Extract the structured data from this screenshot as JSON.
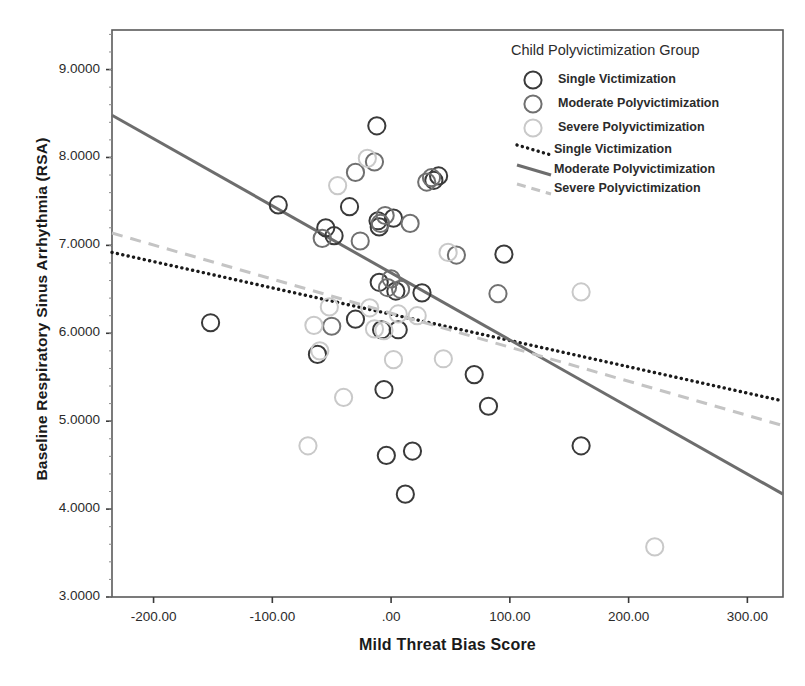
{
  "chart_data": {
    "type": "scatter",
    "title": "",
    "xlabel": "Mild Threat Bias Score",
    "ylabel": "Baseline Respiratory Sinus Arrhythmia (RSA)",
    "xlim": [
      -235,
      330
    ],
    "ylim": [
      3.0,
      9.45
    ],
    "grid": false,
    "legend_position": "top-right",
    "legend_title": "Child Polyvictimization Group",
    "xticks": [
      -200,
      -100,
      0,
      100,
      200,
      300
    ],
    "xtick_labels": [
      "-200.00",
      "-100.00",
      ".00",
      "100.00",
      "200.00",
      "300.00"
    ],
    "yticks": [
      3,
      4,
      5,
      6,
      7,
      8,
      9
    ],
    "ytick_labels": [
      "3.0000",
      "4.0000",
      "5.0000",
      "6.0000",
      "7.0000",
      "8.0000",
      "9.0000"
    ],
    "colors": {
      "single": "#3a3a3a",
      "moderate": "#707070",
      "severe": "#c9c9c9"
    },
    "series": [
      {
        "name": "Single Victimization",
        "marker": "open-circle",
        "color": "#3a3a3a",
        "points": [
          [
            -152,
            6.12
          ],
          [
            -95,
            7.46
          ],
          [
            -62,
            5.76
          ],
          [
            -55,
            7.2
          ],
          [
            -48,
            7.11
          ],
          [
            -35,
            7.44
          ],
          [
            -30,
            6.16
          ],
          [
            -12,
            8.36
          ],
          [
            -11,
            7.28
          ],
          [
            -10,
            7.21
          ],
          [
            -10,
            6.58
          ],
          [
            -8,
            6.04
          ],
          [
            -6,
            5.36
          ],
          [
            -4,
            4.61
          ],
          [
            2,
            7.31
          ],
          [
            4,
            6.48
          ],
          [
            6,
            6.04
          ],
          [
            12,
            4.17
          ],
          [
            18,
            4.66
          ],
          [
            26,
            6.46
          ],
          [
            36,
            7.74
          ],
          [
            40,
            7.79
          ],
          [
            70,
            5.53
          ],
          [
            82,
            5.17
          ],
          [
            95,
            6.9
          ],
          [
            160,
            4.72
          ]
        ]
      },
      {
        "name": "Moderate Polyvictimization",
        "marker": "open-circle",
        "color": "#707070",
        "points": [
          [
            -58,
            7.08
          ],
          [
            -50,
            6.08
          ],
          [
            -30,
            7.83
          ],
          [
            -26,
            7.05
          ],
          [
            -14,
            7.95
          ],
          [
            -9,
            7.25
          ],
          [
            -5,
            7.34
          ],
          [
            -3,
            6.52
          ],
          [
            0,
            6.62
          ],
          [
            8,
            6.5
          ],
          [
            16,
            7.25
          ],
          [
            30,
            7.72
          ],
          [
            34,
            7.77
          ],
          [
            55,
            6.89
          ],
          [
            90,
            6.45
          ]
        ]
      },
      {
        "name": "Severe Polyvictimization",
        "marker": "open-circle",
        "color": "#c9c9c9",
        "points": [
          [
            -70,
            4.72
          ],
          [
            -65,
            6.09
          ],
          [
            -60,
            5.8
          ],
          [
            -52,
            6.3
          ],
          [
            -45,
            7.68
          ],
          [
            -40,
            5.27
          ],
          [
            -20,
            7.99
          ],
          [
            -18,
            6.29
          ],
          [
            -14,
            6.05
          ],
          [
            -6,
            6.03
          ],
          [
            2,
            5.7
          ],
          [
            6,
            6.22
          ],
          [
            22,
            6.2
          ],
          [
            44,
            5.71
          ],
          [
            48,
            6.92
          ],
          [
            160,
            6.47
          ],
          [
            222,
            3.57
          ]
        ]
      }
    ],
    "fit_lines": [
      {
        "name": "Single Victimization",
        "style": "dotted",
        "color": "#1a1a1a",
        "x0": -235,
        "y0": 6.92,
        "x1": 330,
        "y1": 5.23
      },
      {
        "name": "Moderate Polyvictimization",
        "style": "solid",
        "color": "#6d6d6d",
        "x0": -235,
        "y0": 8.48,
        "x1": 330,
        "y1": 4.17
      },
      {
        "name": "Severe Polyvictimization",
        "style": "dashed",
        "color": "#c4c4c4",
        "x0": -235,
        "y0": 7.14,
        "x1": 330,
        "y1": 4.95
      }
    ]
  },
  "legend": {
    "title": "Child Polyvictimization Group",
    "marker_entries": [
      {
        "label": "Single Victimization"
      },
      {
        "label": "Moderate Polyvictimization"
      },
      {
        "label": "Severe Polyvictimization"
      }
    ],
    "line_entries": [
      {
        "label": "Single Victimization"
      },
      {
        "label": "Moderate Polyvictimization"
      },
      {
        "label": "Severe Polyvictimization"
      }
    ]
  }
}
